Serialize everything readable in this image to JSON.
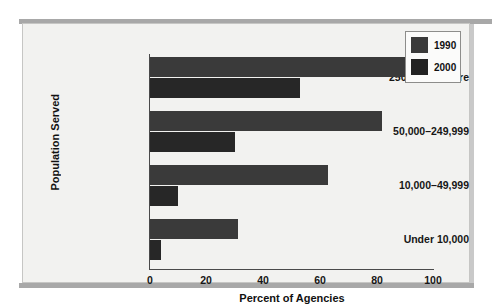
{
  "chart_data": {
    "type": "bar",
    "orientation": "horizontal",
    "title": "",
    "xlabel": "Percent of Agencies",
    "ylabel": "Population Served",
    "categories": [
      "250,000 or more",
      "50,000–249,999",
      "10,000–49,999",
      "Under 10,000"
    ],
    "series": [
      {
        "name": "1990",
        "color": "#3a3a3a",
        "values": [
          90,
          82,
          63,
          31
        ]
      },
      {
        "name": "2000",
        "color": "#272727",
        "values": [
          53,
          30,
          10,
          4
        ]
      }
    ],
    "xlim": [
      0,
      100
    ],
    "xticks": [
      "0",
      "20",
      "40",
      "60",
      "80",
      "100"
    ],
    "grid": false,
    "legend_position": "top-right"
  },
  "legend": {
    "items": [
      {
        "label": "1990"
      },
      {
        "label": "2000"
      }
    ]
  }
}
